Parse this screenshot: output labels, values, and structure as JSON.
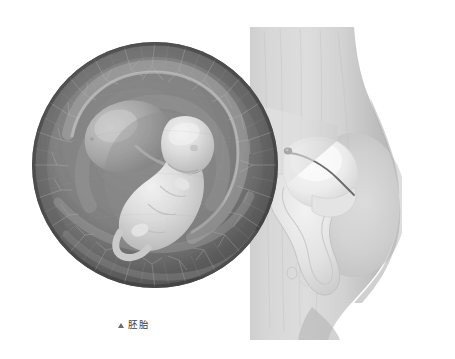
{
  "figure": {
    "type": "medical-illustration",
    "palette": {
      "background": "#ffffff",
      "skin_light": "#d9d9d9",
      "skin_mid": "#c2c2c2",
      "skin_shadow": "#a8a8a8",
      "chorion_dark": "#6d6d6d",
      "chorion_darker": "#585858",
      "chorion_mid": "#8a8a8a",
      "amnion_light": "#b9b9b9",
      "yolk_sac": "#9e9e9e",
      "embryo_body": "#dcdcdc",
      "embryo_highlight": "#ededed",
      "uterus_pale": "#e6e6e6",
      "uterus_wall": "#cfcfcf",
      "cord_dark": "#6a6a6a",
      "cone_tint": "#e2e2e2",
      "caption_text": "#3d3d3d",
      "caption_marker": "#6b6b6b"
    }
  },
  "caption": {
    "marker_icon": "triangle-up-icon",
    "label": "胚胎"
  },
  "magnified_view": {
    "name": "embryo-magnified-circle",
    "shape": "circle",
    "center": {
      "x": 155,
      "y": 165
    },
    "radius": 123,
    "contents": [
      "chorionic villi ring",
      "amniotic sac",
      "yolk sac",
      "embryo body",
      "umbilical cord"
    ]
  },
  "torso_view": {
    "name": "maternal-torso-sagittal",
    "contents": [
      "abdominal wall",
      "uterus",
      "implanted embryo",
      "cervix",
      "vaginal canal"
    ]
  },
  "magnifier_cone": {
    "name": "magnification-cone",
    "from": "uterus-embryo-site",
    "to": "embryo-magnified-circle"
  }
}
